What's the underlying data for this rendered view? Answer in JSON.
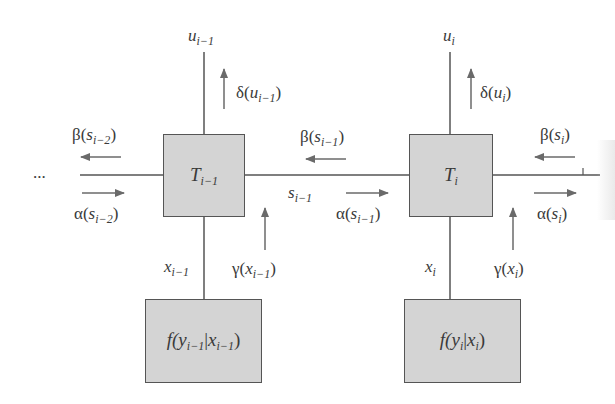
{
  "diagram": {
    "type": "factor-graph / forward-backward message passing",
    "ellipsis": "...",
    "nodes": [
      {
        "id": "T_prev",
        "label_main": "T",
        "label_sub": "i−1"
      },
      {
        "id": "T_cur",
        "label_main": "T",
        "label_sub": "i"
      },
      {
        "id": "f_prev",
        "label_pre": "f(",
        "label_y": "y",
        "label_y_sub": "i−1",
        "label_bar": "|",
        "label_x": "x",
        "label_x_sub": "i−1",
        "label_post": ")"
      },
      {
        "id": "f_cur",
        "label_pre": "f(",
        "label_y": "y",
        "label_y_sub": "i",
        "label_bar": "|",
        "label_x": "x",
        "label_x_sub": "i",
        "label_post": ")"
      }
    ],
    "variables": {
      "u_prev": {
        "main": "u",
        "sub": "i−1"
      },
      "u_cur": {
        "main": "u",
        "sub": "i"
      },
      "s_prev": {
        "main": "s",
        "sub": "i−1"
      },
      "x_prev": {
        "main": "x",
        "sub": "i−1"
      },
      "x_cur": {
        "main": "x",
        "sub": "i"
      }
    },
    "messages": {
      "beta_s_im2": {
        "fn": "β(",
        "var": "s",
        "sub": "i−2",
        "close": ")",
        "direction": "left"
      },
      "alpha_s_im2": {
        "fn": "α(",
        "var": "s",
        "sub": "i−2",
        "close": ")",
        "direction": "right"
      },
      "beta_s_im1": {
        "fn": "β(",
        "var": "s",
        "sub": "i−1",
        "close": ")",
        "direction": "left"
      },
      "alpha_s_im1": {
        "fn": "α(",
        "var": "s",
        "sub": "i−1",
        "close": ")",
        "direction": "right"
      },
      "beta_s_i": {
        "fn": "β(",
        "var": "s",
        "sub": "i",
        "close": ")",
        "direction": "left"
      },
      "alpha_s_i": {
        "fn": "α(",
        "var": "s",
        "sub": "i",
        "close": ")",
        "direction": "right"
      },
      "delta_u_im1": {
        "fn": "δ(",
        "var": "u",
        "sub": "i−1",
        "close": ")",
        "direction": "up"
      },
      "delta_u_i": {
        "fn": "δ(",
        "var": "u",
        "sub": "i",
        "close": ")",
        "direction": "up"
      },
      "gamma_x_im1": {
        "fn": "γ(",
        "var": "x",
        "sub": "i−1",
        "close": ")",
        "direction": "up"
      },
      "gamma_x_i": {
        "fn": "γ(",
        "var": "x",
        "sub": "i",
        "close": ")",
        "direction": "up"
      }
    },
    "colors": {
      "box_fill": "#d4d4d4",
      "line": "#555555",
      "arrow": "#6a6a6a",
      "text": "#3a3a3a"
    }
  }
}
